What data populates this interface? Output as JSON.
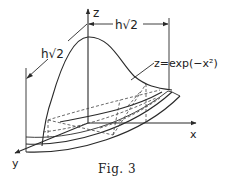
{
  "figure": {
    "caption_prefix": "Fig.",
    "caption_number": "3",
    "caption": "Fig. 3"
  },
  "axes": {
    "z_label": "z",
    "x_label": "x",
    "y_label": "y"
  },
  "dimensions": {
    "left_label": "h√2",
    "top_label": "h√2"
  },
  "annotations": {
    "surface_label": "z=exp(−x²)"
  },
  "colors": {
    "ink": "#2a2a2a",
    "background": "#ffffff"
  }
}
